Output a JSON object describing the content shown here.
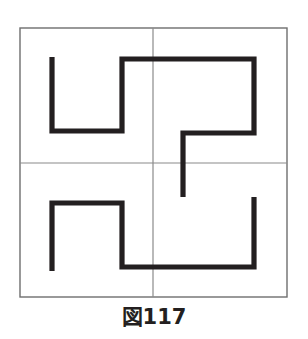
{
  "figure": {
    "caption": "図117",
    "caption_label": "figure-117",
    "title": "図117",
    "type": "geometric-line-diagram"
  },
  "colors": {
    "background": "#ffffff",
    "frame_stroke": "#6e6e6e",
    "grid_stroke": "#8a8a8a",
    "path_stroke": "#231f20",
    "caption_text": "#231f20"
  },
  "geometry": {
    "frame": {
      "x": 20,
      "y": 28,
      "width": 267,
      "height": 269,
      "stroke_width": 1.4
    },
    "grid": {
      "center_x": 153,
      "center_y": 163,
      "vertical_line": {
        "x": 153,
        "y1": 28,
        "y2": 297
      },
      "horizontal_line": {
        "y": 163,
        "x1": 20,
        "x2": 287
      },
      "stroke_width": 1.2
    },
    "paths": {
      "stroke_width": 5.2,
      "upper": {
        "name": "upper-pinwheel-path",
        "points": "52,57 52,131 122,131 122,59 254,59 254,133 183,133 183,197"
      },
      "lower": {
        "name": "lower-pinwheel-path",
        "points": "254,197 254,267 122,267 122,203 52,203 52,271"
      }
    }
  },
  "chart_data": {
    "type": "line",
    "title": "図117",
    "xlabel": "",
    "ylabel": "",
    "xlim": [
      20,
      287
    ],
    "ylim": [
      28,
      297
    ],
    "grid": true,
    "legend": "none",
    "annotations": [
      "図117"
    ],
    "series": [
      {
        "name": "upper-pinwheel-path",
        "x": [
          52,
          52,
          122,
          122,
          254,
          254,
          183,
          183
        ],
        "y": [
          57,
          131,
          131,
          59,
          59,
          133,
          133,
          197
        ]
      },
      {
        "name": "lower-pinwheel-path",
        "x": [
          254,
          254,
          122,
          122,
          52,
          52
        ],
        "y": [
          197,
          267,
          267,
          203,
          203,
          271
        ]
      }
    ]
  }
}
